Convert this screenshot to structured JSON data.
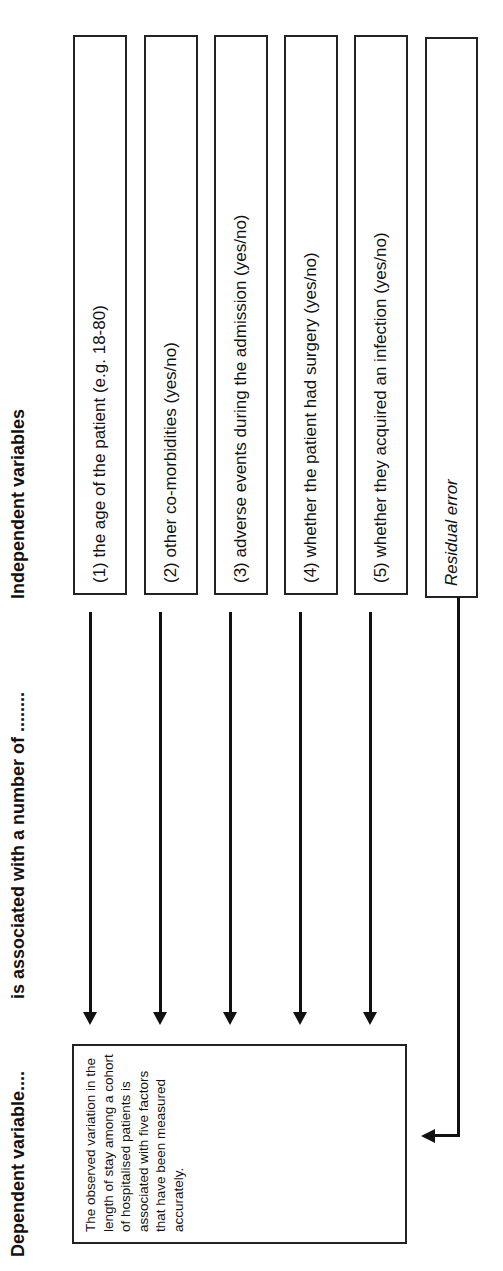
{
  "headers": {
    "dependent": "Dependent variable....",
    "association": "is associated with a number of ........",
    "independent": "Independent variables"
  },
  "dependent_box": {
    "text": "The observed variation in the length of stay among a cohort of hospitalised patients is associated with five factors that have been measured accurately."
  },
  "independent_variables": [
    {
      "label": "(1) the age of the patient (e.g. 18-80)"
    },
    {
      "label": "(2) other co-morbidities (yes/no)"
    },
    {
      "label": "(3) adverse events during the admission (yes/no)"
    },
    {
      "label": "(4) whether the patient had surgery  (yes/no)"
    },
    {
      "label": "(5) whether they acquired an infection  (yes/no)"
    }
  ],
  "residual": {
    "label": "Residual error"
  },
  "orientation": "rotated 90 degrees counter-clockwise"
}
